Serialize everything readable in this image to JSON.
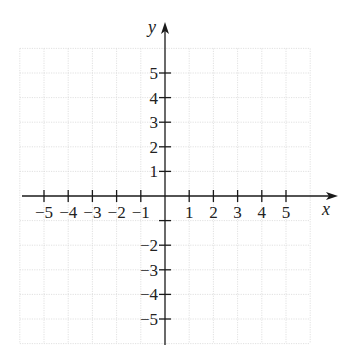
{
  "chart_data": {
    "type": "coordinate-plane",
    "title": "",
    "xlabel": "x",
    "ylabel": "y",
    "xlim": [
      -6,
      6
    ],
    "ylim": [
      -6,
      6
    ],
    "grid": true,
    "x_ticks": [
      -5,
      -4,
      -3,
      -2,
      -1,
      1,
      2,
      3,
      4,
      5
    ],
    "x_tick_labels": [
      "−5",
      "−4",
      "−3",
      "−2",
      "−1",
      "1",
      "2",
      "3",
      "4",
      "5"
    ],
    "y_ticks": [
      5,
      4,
      3,
      2,
      1,
      -1,
      -2,
      -3,
      -4,
      -5
    ],
    "y_tick_labels": [
      "5",
      "4",
      "3",
      "2",
      "1",
      "",
      "−2",
      "−3",
      "−4",
      "−5"
    ],
    "series": []
  },
  "axes": {
    "x_label": "x",
    "y_label": "y"
  },
  "colors": {
    "axis": "#1a1a1a",
    "grid": "#d9d9d9",
    "text": "#222222"
  }
}
